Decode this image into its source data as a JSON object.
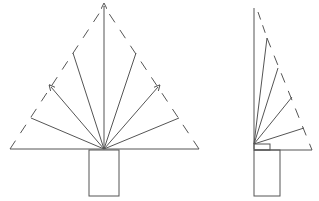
{
  "figure": {
    "stroke_color": "#555555",
    "background": "#ffffff",
    "front_view": {
      "apex": [
        104,
        6
      ],
      "origin": [
        104,
        149
      ],
      "base_left": [
        10,
        149
      ],
      "base_right": [
        199,
        149
      ],
      "rays": [
        [
          31,
          118
        ],
        [
          51,
          87
        ],
        [
          73,
          53
        ],
        [
          104,
          6
        ],
        [
          136,
          53
        ],
        [
          158,
          87
        ],
        [
          179,
          118
        ]
      ],
      "trunk": {
        "x": 89,
        "y": 150,
        "w": 30,
        "h": 46
      }
    },
    "side_view": {
      "stem": [
        [
          254,
          8
        ],
        [
          254,
          149
        ]
      ],
      "rays": [
        [
          267,
          38
        ],
        [
          278,
          68
        ],
        [
          292,
          97
        ],
        [
          304,
          128
        ]
      ],
      "base": [
        [
          254,
          150
        ],
        [
          312,
          150
        ]
      ],
      "collar": {
        "x": 254,
        "y": 144,
        "w": 16,
        "h": 6
      },
      "trunk": {
        "x": 254,
        "y": 150,
        "w": 26,
        "h": 46
      }
    }
  }
}
